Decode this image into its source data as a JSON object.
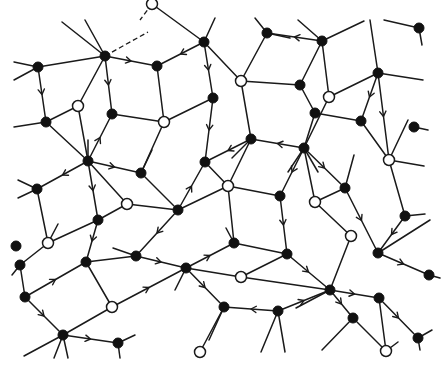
{
  "diagram": {
    "type": "directed-tiling-graph",
    "colors": {
      "line": "#1a1a1a",
      "filled_node": "#111111",
      "open_node": "#ffffff",
      "background": "#ffffff"
    },
    "node_radius": 5,
    "nodes": [
      {
        "id": "n1",
        "x": 152,
        "y": 4,
        "kind": "open"
      },
      {
        "id": "n2",
        "x": 204,
        "y": 42,
        "kind": "filled"
      },
      {
        "id": "n3",
        "x": 267,
        "y": 33,
        "kind": "filled"
      },
      {
        "id": "n4",
        "x": 322,
        "y": 41,
        "kind": "filled"
      },
      {
        "id": "n5",
        "x": 419,
        "y": 28,
        "kind": "filled"
      },
      {
        "id": "n6",
        "x": 38,
        "y": 67,
        "kind": "filled"
      },
      {
        "id": "n7",
        "x": 105,
        "y": 56,
        "kind": "filled"
      },
      {
        "id": "n8",
        "x": 157,
        "y": 66,
        "kind": "filled"
      },
      {
        "id": "n9",
        "x": 241,
        "y": 81,
        "kind": "open"
      },
      {
        "id": "n10",
        "x": 300,
        "y": 85,
        "kind": "filled"
      },
      {
        "id": "n11",
        "x": 378,
        "y": 73,
        "kind": "filled"
      },
      {
        "id": "n12",
        "x": 78,
        "y": 106,
        "kind": "open"
      },
      {
        "id": "n13",
        "x": 112,
        "y": 114,
        "kind": "filled"
      },
      {
        "id": "n14",
        "x": 213,
        "y": 98,
        "kind": "filled"
      },
      {
        "id": "n15",
        "x": 315,
        "y": 113,
        "kind": "filled"
      },
      {
        "id": "n16",
        "x": 46,
        "y": 122,
        "kind": "filled"
      },
      {
        "id": "n17",
        "x": 164,
        "y": 122,
        "kind": "open"
      },
      {
        "id": "n18",
        "x": 251,
        "y": 139,
        "kind": "filled"
      },
      {
        "id": "n19",
        "x": 329,
        "y": 97,
        "kind": "open"
      },
      {
        "id": "n20",
        "x": 414,
        "y": 127,
        "kind": "filled"
      },
      {
        "id": "n21",
        "x": 361,
        "y": 121,
        "kind": "filled"
      },
      {
        "id": "n22",
        "x": 88,
        "y": 161,
        "kind": "filled"
      },
      {
        "id": "n23",
        "x": 141,
        "y": 173,
        "kind": "filled"
      },
      {
        "id": "n24",
        "x": 205,
        "y": 162,
        "kind": "filled"
      },
      {
        "id": "n25",
        "x": 304,
        "y": 148,
        "kind": "filled"
      },
      {
        "id": "n26",
        "x": 389,
        "y": 160,
        "kind": "open"
      },
      {
        "id": "n27",
        "x": 37,
        "y": 189,
        "kind": "filled"
      },
      {
        "id": "n28",
        "x": 127,
        "y": 204,
        "kind": "open"
      },
      {
        "id": "n29",
        "x": 178,
        "y": 210,
        "kind": "filled"
      },
      {
        "id": "n30",
        "x": 228,
        "y": 186,
        "kind": "open"
      },
      {
        "id": "n31",
        "x": 280,
        "y": 196,
        "kind": "filled"
      },
      {
        "id": "n32",
        "x": 315,
        "y": 202,
        "kind": "open"
      },
      {
        "id": "n33",
        "x": 345,
        "y": 188,
        "kind": "filled"
      },
      {
        "id": "n34",
        "x": 405,
        "y": 216,
        "kind": "filled"
      },
      {
        "id": "n35",
        "x": 98,
        "y": 220,
        "kind": "filled"
      },
      {
        "id": "n36",
        "x": 48,
        "y": 243,
        "kind": "open"
      },
      {
        "id": "n37",
        "x": 136,
        "y": 256,
        "kind": "filled"
      },
      {
        "id": "n38",
        "x": 234,
        "y": 243,
        "kind": "filled"
      },
      {
        "id": "n39",
        "x": 287,
        "y": 254,
        "kind": "filled"
      },
      {
        "id": "n40",
        "x": 351,
        "y": 236,
        "kind": "open"
      },
      {
        "id": "n41",
        "x": 378,
        "y": 253,
        "kind": "filled"
      },
      {
        "id": "n42",
        "x": 20,
        "y": 265,
        "kind": "filled"
      },
      {
        "id": "n43",
        "x": 86,
        "y": 262,
        "kind": "filled"
      },
      {
        "id": "n44",
        "x": 186,
        "y": 268,
        "kind": "filled"
      },
      {
        "id": "n45",
        "x": 241,
        "y": 277,
        "kind": "open"
      },
      {
        "id": "n46",
        "x": 330,
        "y": 290,
        "kind": "filled"
      },
      {
        "id": "n47",
        "x": 429,
        "y": 275,
        "kind": "filled"
      },
      {
        "id": "n48",
        "x": 25,
        "y": 297,
        "kind": "filled"
      },
      {
        "id": "n49",
        "x": 112,
        "y": 307,
        "kind": "open"
      },
      {
        "id": "n50",
        "x": 224,
        "y": 307,
        "kind": "filled"
      },
      {
        "id": "n51",
        "x": 278,
        "y": 311,
        "kind": "filled"
      },
      {
        "id": "n52",
        "x": 379,
        "y": 298,
        "kind": "filled"
      },
      {
        "id": "n53",
        "x": 63,
        "y": 335,
        "kind": "filled"
      },
      {
        "id": "n54",
        "x": 118,
        "y": 343,
        "kind": "filled"
      },
      {
        "id": "n55",
        "x": 200,
        "y": 352,
        "kind": "open"
      },
      {
        "id": "n56",
        "x": 353,
        "y:": 318,
        "y": 318,
        "kind": "filled"
      },
      {
        "id": "n57",
        "x": 418,
        "y": 338,
        "kind": "filled"
      },
      {
        "id": "n58",
        "x": 386,
        "y": 351,
        "kind": "open"
      },
      {
        "id": "n59",
        "x": 16,
        "y": 246,
        "kind": "filled"
      }
    ],
    "edges": [
      {
        "from": "n6",
        "to": "n7",
        "dir": "none"
      },
      {
        "from": "n6",
        "to": "n16",
        "dir": "forward"
      },
      {
        "from": "n7",
        "to": "n12",
        "dir": "none"
      },
      {
        "from": "n7",
        "to": "n13",
        "dir": "forward"
      },
      {
        "from": "n7",
        "to": "n8",
        "dir": "forward"
      },
      {
        "from": "n1",
        "to": "n2",
        "dir": "none"
      },
      {
        "from": "n2",
        "to": "n8",
        "dir": "forward"
      },
      {
        "from": "n2",
        "to": "n14",
        "dir": "forward"
      },
      {
        "from": "n2",
        "to": "n9",
        "dir": "none"
      },
      {
        "from": "n3",
        "to": "n9",
        "dir": "none"
      },
      {
        "from": "n4",
        "to": "n3",
        "dir": "forward"
      },
      {
        "from": "n4",
        "to": "n19",
        "dir": "none"
      },
      {
        "from": "n4",
        "to": "n10",
        "dir": "none"
      },
      {
        "from": "n8",
        "to": "n17",
        "dir": "none"
      },
      {
        "from": "n9",
        "to": "n10",
        "dir": "none"
      },
      {
        "from": "n9",
        "to": "n18",
        "dir": "none"
      },
      {
        "from": "n10",
        "to": "n15",
        "dir": "none"
      },
      {
        "from": "n11",
        "to": "n19",
        "dir": "none"
      },
      {
        "from": "n11",
        "to": "n21",
        "dir": "forward"
      },
      {
        "from": "n11",
        "to": "n26",
        "dir": "forward"
      },
      {
        "from": "n12",
        "to": "n16",
        "dir": "none"
      },
      {
        "from": "n12",
        "to": "n22",
        "dir": "none"
      },
      {
        "from": "n13",
        "to": "n17",
        "dir": "none"
      },
      {
        "from": "n13",
        "to": "n22",
        "dir": "backward"
      },
      {
        "from": "n14",
        "to": "n17",
        "dir": "none"
      },
      {
        "from": "n14",
        "to": "n24",
        "dir": "forward"
      },
      {
        "from": "n16",
        "to": "n22",
        "dir": "none"
      },
      {
        "from": "n17",
        "to": "n23",
        "dir": "none"
      },
      {
        "from": "n18",
        "to": "n24",
        "dir": "forward"
      },
      {
        "from": "n18",
        "to": "n25",
        "dir": "backward"
      },
      {
        "from": "n18",
        "to": "n30",
        "dir": "none"
      },
      {
        "from": "n15",
        "to": "n25",
        "dir": "none"
      },
      {
        "from": "n15",
        "to": "n21",
        "dir": "none"
      },
      {
        "from": "n19",
        "to": "n25",
        "dir": "none"
      },
      {
        "from": "n22",
        "to": "n23",
        "dir": "forward"
      },
      {
        "from": "n22",
        "to": "n27",
        "dir": "forward"
      },
      {
        "from": "n22",
        "to": "n28",
        "dir": "none"
      },
      {
        "from": "n22",
        "to": "n35",
        "dir": "forward"
      },
      {
        "from": "n23",
        "to": "n29",
        "dir": "none"
      },
      {
        "from": "n24",
        "to": "n30",
        "dir": "none"
      },
      {
        "from": "n24",
        "to": "n29",
        "dir": "backward"
      },
      {
        "from": "n25",
        "to": "n31",
        "dir": "forward"
      },
      {
        "from": "n25",
        "to": "n33",
        "dir": "forward"
      },
      {
        "from": "n25",
        "to": "n32",
        "dir": "none"
      },
      {
        "from": "n21",
        "to": "n26",
        "dir": "none"
      },
      {
        "from": "n26",
        "to": "n34",
        "dir": "none"
      },
      {
        "from": "n27",
        "to": "n36",
        "dir": "none"
      },
      {
        "from": "n28",
        "to": "n35",
        "dir": "none"
      },
      {
        "from": "n28",
        "to": "n29",
        "dir": "none"
      },
      {
        "from": "n29",
        "to": "n30",
        "dir": "none"
      },
      {
        "from": "n29",
        "to": "n37",
        "dir": "forward"
      },
      {
        "from": "n30",
        "to": "n31",
        "dir": "none"
      },
      {
        "from": "n30",
        "to": "n38",
        "dir": "none"
      },
      {
        "from": "n31",
        "to": "n39",
        "dir": "forward"
      },
      {
        "from": "n32",
        "to": "n33",
        "dir": "none"
      },
      {
        "from": "n32",
        "to": "n40",
        "dir": "none"
      },
      {
        "from": "n33",
        "to": "n41",
        "dir": "forward"
      },
      {
        "from": "n34",
        "to": "n41",
        "dir": "forward"
      },
      {
        "from": "n35",
        "to": "n36",
        "dir": "none"
      },
      {
        "from": "n35",
        "to": "n43",
        "dir": "forward"
      },
      {
        "from": "n36",
        "to": "n42",
        "dir": "none"
      },
      {
        "from": "n37",
        "to": "n43",
        "dir": "none"
      },
      {
        "from": "n37",
        "to": "n44",
        "dir": "forward"
      },
      {
        "from": "n38",
        "to": "n44",
        "dir": "backward"
      },
      {
        "from": "n38",
        "to": "n39",
        "dir": "none"
      },
      {
        "from": "n39",
        "to": "n45",
        "dir": "none"
      },
      {
        "from": "n39",
        "to": "n46",
        "dir": "forward"
      },
      {
        "from": "n40",
        "to": "n46",
        "dir": "none"
      },
      {
        "from": "n41",
        "to": "n47",
        "dir": "forward"
      },
      {
        "from": "n42",
        "to": "n48",
        "dir": "none"
      },
      {
        "from": "n43",
        "to": "n49",
        "dir": "none"
      },
      {
        "from": "n43",
        "to": "n48",
        "dir": "backward"
      },
      {
        "from": "n44",
        "to": "n45",
        "dir": "none"
      },
      {
        "from": "n44",
        "to": "n50",
        "dir": "forward"
      },
      {
        "from": "n44",
        "to": "n49",
        "dir": "backward"
      },
      {
        "from": "n45",
        "to": "n46",
        "dir": "none"
      },
      {
        "from": "n46",
        "to": "n51",
        "dir": "backward"
      },
      {
        "from": "n46",
        "to": "n52",
        "dir": "forward"
      },
      {
        "from": "n46",
        "to": "n56",
        "dir": "forward"
      },
      {
        "from": "n48",
        "to": "n53",
        "dir": "forward"
      },
      {
        "from": "n49",
        "to": "n53",
        "dir": "none"
      },
      {
        "from": "n50",
        "to": "n55",
        "dir": "none"
      },
      {
        "from": "n50",
        "to": "n51",
        "dir": "backward"
      },
      {
        "from": "n53",
        "to": "n54",
        "dir": "forward"
      },
      {
        "from": "n52",
        "to": "n58",
        "dir": "none"
      },
      {
        "from": "n52",
        "to": "n57",
        "dir": "forward"
      },
      {
        "from": "n56",
        "to": "n58",
        "dir": "none"
      }
    ]
  }
}
